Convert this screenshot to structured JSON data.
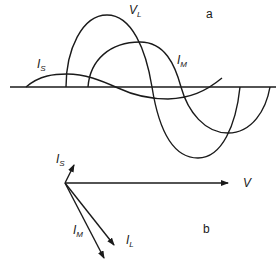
{
  "figure": {
    "panel_a": {
      "tag": "a",
      "labels": {
        "vl": {
          "main": "V",
          "sub": "L"
        },
        "im": {
          "main": "I",
          "sub": "M"
        },
        "is": {
          "main": "I",
          "sub": "S"
        }
      }
    },
    "panel_b": {
      "tag": "b",
      "labels": {
        "is": {
          "main": "I",
          "sub": "S"
        },
        "v": {
          "main": "V"
        },
        "im": {
          "main": "I",
          "sub": "M"
        },
        "il": {
          "main": "I",
          "sub": "L"
        }
      }
    },
    "colors": {
      "ink": "#1a1a1a",
      "background": "#ffffff"
    }
  }
}
